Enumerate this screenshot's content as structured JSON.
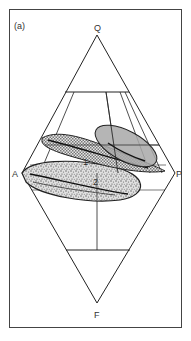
{
  "figure": {
    "panel_label": "(a)",
    "vertices": {
      "top": "Q",
      "left": "A",
      "right": "P",
      "bottom": "F"
    },
    "fields": [
      {
        "id": "1",
        "label": "1",
        "fill": "crosshatch"
      },
      {
        "id": "2",
        "label": "2",
        "fill": "stippled"
      },
      {
        "id": "3",
        "label": "",
        "fill": "grey"
      }
    ],
    "colors": {
      "line": "#222222",
      "frame": "#444444",
      "grey_field": "#a8a8a8",
      "crosshatch_field": "#c0c0c0",
      "stipple_field": "#d8d8d8"
    }
  }
}
